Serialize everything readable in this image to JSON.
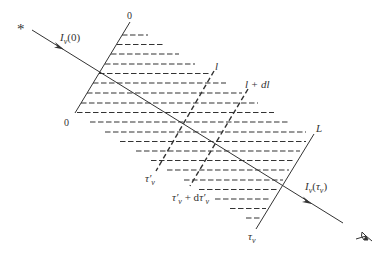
{
  "diagram": {
    "type": "radiative-transfer-slab",
    "labels": {
      "source_symbol": "*",
      "incident_intensity": "I_ν(0)",
      "incident_intensity_parts": {
        "base": "I",
        "sub": "ν",
        "arg": "(0)"
      },
      "top_zero": "0",
      "bottom_zero": "0",
      "path_l": "l",
      "path_l_dl": "l + dl",
      "path_L": "L",
      "tau_prime": "τ′_ν",
      "tau_prime_parts": {
        "base": "τ′",
        "sub": "ν"
      },
      "tau_prime_dtau": "τ′_ν + dτ′_ν",
      "tau_prime_dtau_parts": {
        "base1": "τ′",
        "sub1": "ν",
        "plus": " + d",
        "base2": "τ′",
        "sub2": "ν"
      },
      "tau_total": "τ_ν",
      "tau_total_parts": {
        "base": "τ",
        "sub": "ν"
      },
      "emergent_intensity": "I_ν(τ_ν)",
      "emergent_intensity_parts": {
        "base": "I",
        "sub": "ν",
        "arg_open": "(",
        "arg_base": "τ",
        "arg_sub": "ν",
        "arg_close": ")"
      }
    },
    "icons": [
      "star-icon",
      "eye-icon",
      "arrowhead-icon"
    ],
    "colors": {
      "ink": "#333333",
      "background": "#ffffff"
    }
  }
}
